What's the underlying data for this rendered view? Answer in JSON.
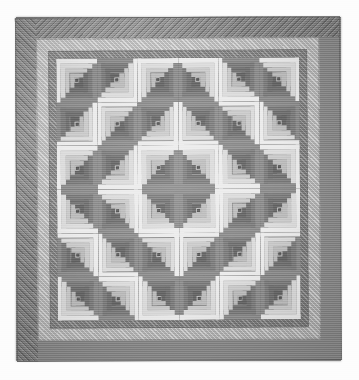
{
  "photo": {
    "subject": "Log Cabin quilt",
    "pattern_name": "Log Cabin — Barn Raising setting",
    "tone": "grayscale",
    "background_color": "#fdfdfd",
    "caption_text": "",
    "frame": {
      "left": 16,
      "top": 17,
      "width": 325,
      "height": 344
    }
  },
  "borders": {
    "outer": {
      "name": "outer border",
      "color": "#8d8d8d",
      "width_px": 21,
      "quilting": "diagonal parallel lines"
    },
    "inner_light": {
      "name": "inner light border",
      "color": "#c6c6c6",
      "width_px": 12,
      "quilting": "diagonal parallel lines"
    },
    "mid_dark": {
      "name": "mid dark border",
      "color": "#939393",
      "width_px": 8,
      "quilting": "diagonal parallel lines"
    },
    "binding": {
      "name": "binding",
      "color": "#6f6f6f"
    }
  },
  "field": {
    "rows": 6,
    "cols": 6,
    "block_count": 36,
    "block_name": "log-cabin-block",
    "logs_per_block": 4,
    "center_color": "#5e5e5e",
    "light_values": [
      "#ececec",
      "#dcdcdc",
      "#cbcbcb",
      "#bdbdbd"
    ],
    "dark_values": [
      "#8f8f8f",
      "#7f7f7f",
      "#737373",
      "#686868"
    ],
    "orientations": [
      [
        "tl",
        "tl",
        "tl",
        "tr",
        "tl",
        "tl"
      ],
      [
        "tl",
        "br",
        "tl",
        "tl",
        "br",
        "tl"
      ],
      [
        "tl",
        "tl",
        "tl",
        "tl",
        "tl",
        "tl"
      ],
      [
        "tl",
        "tl",
        "tl",
        "tl",
        "tl",
        "tl"
      ],
      [
        "tl",
        "tl",
        "tl",
        "tl",
        "tl",
        "tl"
      ],
      [
        "tl",
        "tl",
        "tl",
        "tl",
        "tl",
        "tl"
      ]
    ]
  },
  "chart_data": {
    "type": "heatmap",
    "xlabel": "column",
    "ylabel": "row",
    "categories": [
      "1",
      "2",
      "3",
      "4",
      "5",
      "6"
    ],
    "rows": [
      "1",
      "2",
      "3",
      "4",
      "5",
      "6"
    ],
    "legend": [
      "light logs (upper-left)",
      "dark logs (lower-right)",
      "dark center square"
    ],
    "values": [
      [
        0,
        0,
        0,
        1,
        0,
        0
      ],
      [
        0,
        1,
        0,
        0,
        1,
        0
      ],
      [
        0,
        0,
        0,
        0,
        0,
        0
      ],
      [
        0,
        0,
        0,
        0,
        0,
        0
      ],
      [
        0,
        0,
        0,
        0,
        0,
        0
      ],
      [
        0,
        0,
        0,
        0,
        0,
        0
      ]
    ]
  }
}
